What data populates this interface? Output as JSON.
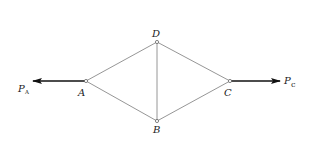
{
  "diagram": {
    "type": "truss",
    "nodes": [
      {
        "id": "A",
        "label": "A",
        "x": 86,
        "y": 81
      },
      {
        "id": "D",
        "label": "D",
        "x": 157,
        "y": 42
      },
      {
        "id": "B",
        "label": "B",
        "x": 157,
        "y": 121
      },
      {
        "id": "C",
        "label": "C",
        "x": 230,
        "y": 81
      }
    ],
    "members": [
      {
        "from": "A",
        "to": "D"
      },
      {
        "from": "A",
        "to": "B"
      },
      {
        "from": "D",
        "to": "C"
      },
      {
        "from": "B",
        "to": "C"
      },
      {
        "from": "D",
        "to": "B"
      }
    ],
    "forces": [
      {
        "id": "PA",
        "symbol": "P",
        "subscript": "A",
        "at": "A",
        "direction": "left"
      },
      {
        "id": "PC",
        "symbol": "P",
        "subscript": "c",
        "at": "C",
        "direction": "right"
      }
    ]
  },
  "labels": {
    "node_a": "A",
    "node_b": "B",
    "node_c": "C",
    "node_d": "D",
    "force_a_symbol": "P",
    "force_a_sub": "A",
    "force_c_symbol": "P",
    "force_c_sub": "c"
  },
  "colors": {
    "line": "#8a8a8a",
    "arrow": "#111111",
    "text": "#222222",
    "background": "#ffffff"
  }
}
